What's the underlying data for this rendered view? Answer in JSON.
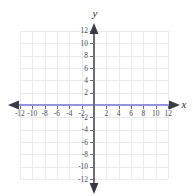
{
  "figure": {
    "type": "coordinate-plane",
    "width": 193,
    "height": 196,
    "background_color": "#ffffff",
    "axis_label_x": "x",
    "axis_label_y": "y",
    "grid_color": "#e9e9ee",
    "x_axis_color": "#9494dd",
    "y_axis_color": "#6d6d78",
    "arrow_color": "#3a3a46"
  },
  "chart_data": {
    "type": "scatter",
    "title": "",
    "xlabel": "x",
    "ylabel": "y",
    "xlim": [
      -12,
      12
    ],
    "ylim": [
      -12,
      12
    ],
    "x_tick_step": 2,
    "y_tick_step": 2,
    "grid": true,
    "grid_step": 2,
    "legend": "none",
    "series": [],
    "x_tick_labels": [
      "-12",
      "-10",
      "-8",
      "-6",
      "-4",
      "-2",
      "2",
      "4",
      "6",
      "8",
      "10",
      "12"
    ],
    "x_tick_values": [
      -12,
      -10,
      -8,
      -6,
      -4,
      -2,
      2,
      4,
      6,
      8,
      10,
      12
    ],
    "y_tick_labels": [
      "12",
      "10",
      "8",
      "6",
      "4",
      "2",
      "-2",
      "-4",
      "-6",
      "-8",
      "-10",
      "-12"
    ],
    "y_tick_values": [
      12,
      10,
      8,
      6,
      4,
      2,
      -2,
      -4,
      -6,
      -8,
      -10,
      -12
    ],
    "origin_label": "",
    "annotations": []
  }
}
